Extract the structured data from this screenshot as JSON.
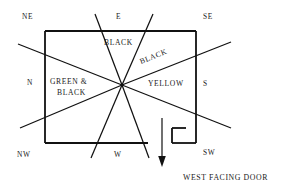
{
  "diagram": {
    "canvas": {
      "width": 281,
      "height": 187
    },
    "stroke_color": "#111111",
    "text_color": "#1a1a1a",
    "background": "#ffffff",
    "compass": {
      "ne": "NE",
      "e": "E",
      "se": "SE",
      "n": "N",
      "s": "S",
      "nw": "NW",
      "w": "W",
      "sw": "SW"
    },
    "zones": {
      "top_black": "BLACK",
      "diagonal_black": "BLACK",
      "green_black_line1": "GREEN &",
      "green_black_line2": "BLACK",
      "yellow": "YELLOW"
    },
    "caption": "WEST FACING DOOR",
    "arrow": {
      "name": "door-direction-arrow",
      "direction": "down"
    }
  }
}
